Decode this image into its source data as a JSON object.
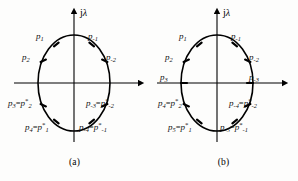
{
  "figure": {
    "background_color": "#fdfdfc",
    "stroke_color": "#000000",
    "axis_label": "jλ"
  },
  "panels": [
    {
      "id": "a",
      "caption": "(a)",
      "axis_label_j": "j",
      "axis_label_lambda": "λ",
      "curve": "ellipse",
      "points": [
        {
          "name": "p1",
          "label_main": "p",
          "sub": "1",
          "eq": "",
          "star_main": "",
          "star_sub": "",
          "x_pct": 36,
          "y_pct": 24
        },
        {
          "name": "p-1",
          "label_main": "p",
          "sub": "-1",
          "eq": "",
          "star_main": "",
          "star_sub": "",
          "x_pct": 62,
          "y_pct": 24
        },
        {
          "name": "p2",
          "label_main": "p",
          "sub": "2",
          "eq": "",
          "star_main": "",
          "star_sub": "",
          "x_pct": 24,
          "y_pct": 38
        },
        {
          "name": "p-2",
          "label_main": "p",
          "sub": "-2",
          "eq": "",
          "star_main": "",
          "star_sub": "",
          "x_pct": 72,
          "y_pct": 38
        },
        {
          "name": "p3",
          "label_main": "p",
          "sub": "3",
          "eq": "=",
          "star_main": "p",
          "star_sub": "2",
          "x_pct": 8,
          "y_pct": 62
        },
        {
          "name": "p-3",
          "label_main": "p",
          "sub": "-3",
          "eq": "=",
          "star_main": "p",
          "star_sub": "-2",
          "x_pct": 62,
          "y_pct": 62
        },
        {
          "name": "p4",
          "label_main": "p",
          "sub": "4",
          "eq": "=",
          "star_main": "p",
          "star_sub": "1",
          "x_pct": 20,
          "y_pct": 76
        },
        {
          "name": "p-4",
          "label_main": "p",
          "sub": "-4",
          "eq": "=",
          "star_main": "p",
          "star_sub": "-1",
          "x_pct": 56,
          "y_pct": 76
        }
      ],
      "point_labels": [
        "p1",
        "p-1",
        "p2",
        "p-2",
        "p3=p*2",
        "p-3=p*-2",
        "p4=p*1",
        "p-4=p*-1"
      ]
    },
    {
      "id": "b",
      "caption": "(b)",
      "axis_label_j": "j",
      "axis_label_lambda": "λ",
      "curve": "ellipse",
      "points": [
        {
          "name": "p1",
          "label_main": "p",
          "sub": "1",
          "eq": "",
          "star_main": "",
          "star_sub": "",
          "x_pct": 36,
          "y_pct": 24
        },
        {
          "name": "p-1",
          "label_main": "p",
          "sub": "-1",
          "eq": "",
          "star_main": "",
          "star_sub": "",
          "x_pct": 62,
          "y_pct": 24
        },
        {
          "name": "p2",
          "label_main": "p",
          "sub": "2",
          "eq": "",
          "star_main": "",
          "star_sub": "",
          "x_pct": 24,
          "y_pct": 38
        },
        {
          "name": "p-2",
          "label_main": "p",
          "sub": "-2",
          "eq": "",
          "star_main": "",
          "star_sub": "",
          "x_pct": 72,
          "y_pct": 38
        },
        {
          "name": "p3",
          "label_main": "p",
          "sub": "3",
          "eq": "",
          "star_main": "",
          "star_sub": "",
          "x_pct": 13,
          "y_pct": 50
        },
        {
          "name": "p-3",
          "label_main": "p",
          "sub": "-3",
          "eq": "",
          "star_main": "",
          "star_sub": "",
          "x_pct": 76,
          "y_pct": 50
        },
        {
          "name": "p4",
          "label_main": "p",
          "sub": "4",
          "eq": "=",
          "star_main": "p",
          "star_sub": "2",
          "x_pct": 8,
          "y_pct": 64
        },
        {
          "name": "p-4",
          "label_main": "p",
          "sub": "-4",
          "eq": "=",
          "star_main": "p",
          "star_sub": "-2",
          "x_pct": 62,
          "y_pct": 64
        },
        {
          "name": "p5",
          "label_main": "p",
          "sub": "5",
          "eq": "=",
          "star_main": "p",
          "star_sub": "1",
          "x_pct": 20,
          "y_pct": 78
        },
        {
          "name": "p-5",
          "label_main": "p",
          "sub": "-5",
          "eq": "=",
          "star_main": "p",
          "star_sub": "-1",
          "x_pct": 54,
          "y_pct": 78
        }
      ],
      "point_labels": [
        "p1",
        "p-1",
        "p2",
        "p-2",
        "p3",
        "p-3",
        "p4=p*2",
        "p-4=p*-2",
        "p5=p*1",
        "p-5=p*-1"
      ]
    }
  ]
}
